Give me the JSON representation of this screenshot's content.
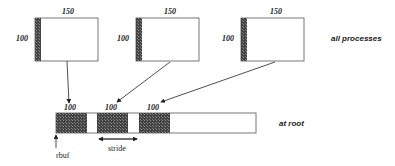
{
  "figure": {
    "type": "gather-with-stride diagram",
    "processes": [
      {
        "width_label": "150",
        "height_label": "100"
      },
      {
        "width_label": "150",
        "height_label": "100"
      },
      {
        "width_label": "150",
        "height_label": "100"
      }
    ],
    "root_buffer": {
      "block_labels": [
        "100",
        "100",
        "100"
      ],
      "pointer_label": "rbuf",
      "stride_label": "stride"
    },
    "side_labels": {
      "top": "all processes",
      "bottom": "at root"
    },
    "colors": {
      "line": "#333333",
      "hatch": "#3a3a3a",
      "background": "#ffffff"
    }
  }
}
